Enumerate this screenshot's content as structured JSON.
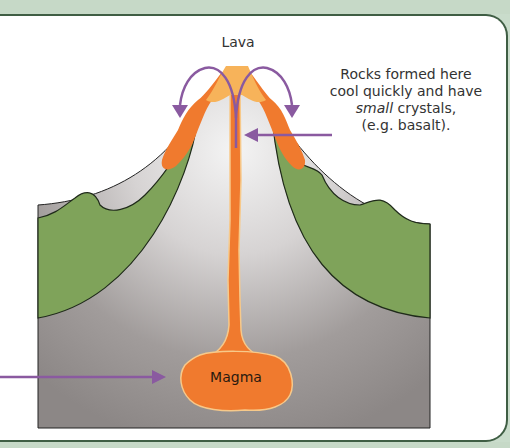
{
  "diagram": {
    "labels": {
      "lava": "Lava",
      "magma": "Magma",
      "rocks_line1": "Rocks formed here",
      "rocks_line2": "cool quickly and have",
      "rocks_line3_italic": "small",
      "rocks_line3_rest": " crystals,",
      "rocks_line4": "(e.g. basalt)."
    },
    "colors": {
      "frame_green": "#c6d9c7",
      "frame_line": "#3f5e44",
      "flank_green": "#7fa35a",
      "rock_grey_dark": "#8f8a88",
      "rock_grey_light": "#f2f2f2",
      "lava_orange": "#f07a2e",
      "lava_light": "#f7b35a",
      "arrow_purple": "#8a5aa0"
    },
    "arrows": [
      {
        "name": "lava-left-arc",
        "direction": "down-left"
      },
      {
        "name": "lava-right-arc",
        "direction": "down-right"
      },
      {
        "name": "rocks-pointer",
        "direction": "left"
      },
      {
        "name": "magma-pointer",
        "direction": "right"
      }
    ]
  }
}
